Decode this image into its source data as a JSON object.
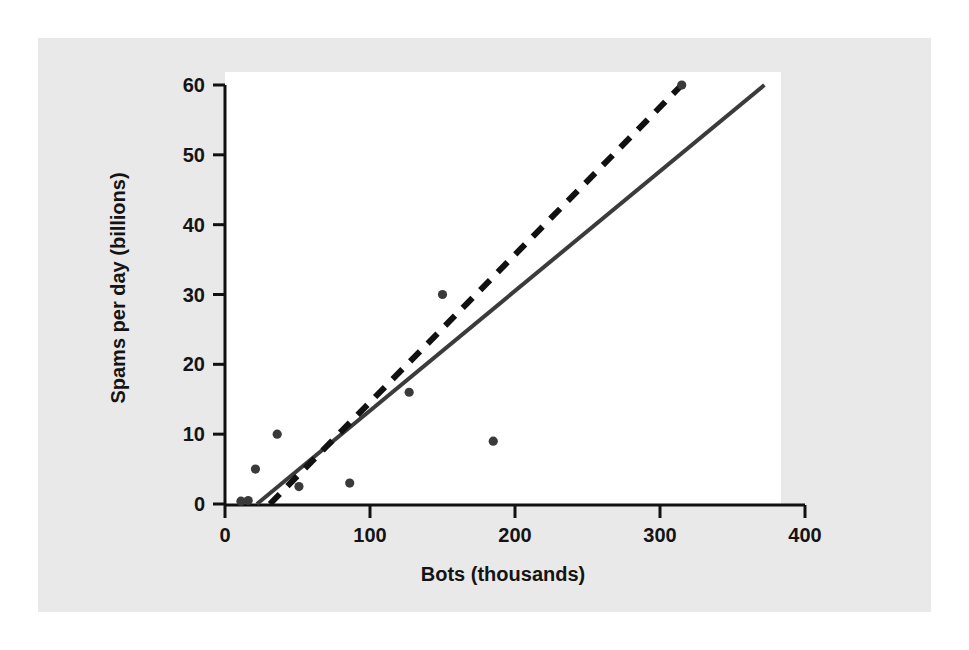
{
  "chart_data": {
    "type": "scatter",
    "title": "",
    "xlabel": "Bots (thousands)",
    "ylabel": "Spams per day (billions)",
    "xlim": [
      0,
      400
    ],
    "ylim": [
      0,
      60
    ],
    "xticks": [
      0,
      100,
      200,
      300,
      400
    ],
    "yticks": [
      0,
      10,
      20,
      30,
      40,
      50,
      60
    ],
    "xtick_labels": [
      "0",
      "100",
      "200",
      "300",
      "400"
    ],
    "ytick_labels": [
      "0",
      "10",
      "20",
      "30",
      "40",
      "50",
      "60"
    ],
    "grid": false,
    "legend": null,
    "points": [
      {
        "x": 11,
        "y": 0.4
      },
      {
        "x": 16,
        "y": 0.5
      },
      {
        "x": 21,
        "y": 5
      },
      {
        "x": 36,
        "y": 10
      },
      {
        "x": 51,
        "y": 2.5
      },
      {
        "x": 86,
        "y": 3
      },
      {
        "x": 127,
        "y": 16
      },
      {
        "x": 150,
        "y": 30
      },
      {
        "x": 185,
        "y": 9
      },
      {
        "x": 315,
        "y": 60
      }
    ],
    "series": [
      {
        "name": "solid-fit-line",
        "style": "solid",
        "color": "#3b3b3b",
        "x": [
          22,
          372
        ],
        "y": [
          0,
          60
        ]
      },
      {
        "name": "dashed-fit-line",
        "style": "dashed",
        "color": "#111111",
        "x": [
          31,
          315
        ],
        "y": [
          0,
          60
        ]
      }
    ],
    "marker_color": "#3a3a3a",
    "axis_color": "#111111",
    "plot_background": "#ffffff",
    "figure_background": "#e9e9e9"
  }
}
